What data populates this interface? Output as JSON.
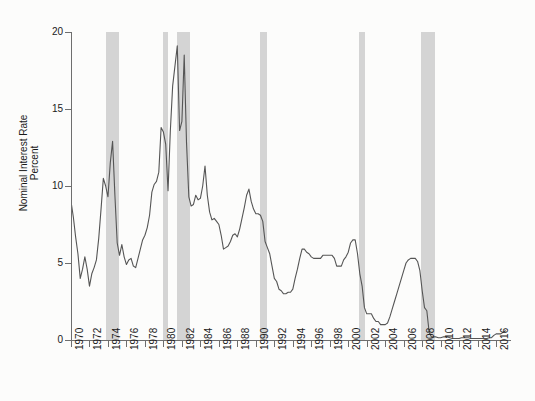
{
  "chart_data": {
    "type": "line",
    "title": "",
    "subtitle": "",
    "xlabel": "",
    "ylabel": "Nominal Interest Rate\nPercent",
    "ylabel_lines": [
      "Nominal Interest Rate",
      "Percent"
    ],
    "xlim": [
      1970,
      2017.5
    ],
    "ylim": [
      0,
      20
    ],
    "y_ticks": [
      0,
      5,
      10,
      15,
      20
    ],
    "y_tick_labels": [
      "0",
      "5",
      "10",
      "15",
      "20"
    ],
    "x_ticks": [
      1970,
      1972,
      1974,
      1976,
      1978,
      1980,
      1982,
      1984,
      1986,
      1988,
      1990,
      1992,
      1994,
      1996,
      1998,
      2000,
      2002,
      2004,
      2006,
      2008,
      2010,
      2012,
      2014,
      2016
    ],
    "x_tick_labels": [
      "1970",
      "1972",
      "1974",
      "1976",
      "1978",
      "1980",
      "1982",
      "1984",
      "1986",
      "1988",
      "1990",
      "1992",
      "1994",
      "1996",
      "1998",
      "2000",
      "2002",
      "2004",
      "2006",
      "2008",
      "2010",
      "2012",
      "2014",
      "2016"
    ],
    "grid": false,
    "legend": null,
    "line_color": "#555555",
    "band_color": "#d4d4d4",
    "background_color": "#fcfcfb",
    "axis_color": "#6e6e6e",
    "series": [
      {
        "name": "Nominal Interest Rate (Percent)",
        "x": [
          1970.0,
          1970.25,
          1970.5,
          1970.75,
          1971.0,
          1971.25,
          1971.5,
          1971.75,
          1972.0,
          1972.25,
          1972.5,
          1972.75,
          1973.0,
          1973.25,
          1973.5,
          1973.75,
          1974.0,
          1974.25,
          1974.5,
          1974.75,
          1975.0,
          1975.25,
          1975.5,
          1975.75,
          1976.0,
          1976.25,
          1976.5,
          1976.75,
          1977.0,
          1977.25,
          1977.5,
          1977.75,
          1978.0,
          1978.25,
          1978.5,
          1978.75,
          1979.0,
          1979.25,
          1979.5,
          1979.75,
          1980.0,
          1980.25,
          1980.5,
          1980.75,
          1981.0,
          1981.25,
          1981.5,
          1981.75,
          1982.0,
          1982.25,
          1982.5,
          1982.75,
          1983.0,
          1983.25,
          1983.5,
          1983.75,
          1984.0,
          1984.25,
          1984.5,
          1984.75,
          1985.0,
          1985.25,
          1985.5,
          1985.75,
          1986.0,
          1986.25,
          1986.5,
          1986.75,
          1987.0,
          1987.25,
          1987.5,
          1987.75,
          1988.0,
          1988.25,
          1988.5,
          1988.75,
          1989.0,
          1989.25,
          1989.5,
          1989.75,
          1990.0,
          1990.25,
          1990.5,
          1990.75,
          1991.0,
          1991.25,
          1991.5,
          1991.75,
          1992.0,
          1992.25,
          1992.5,
          1992.75,
          1993.0,
          1993.25,
          1993.5,
          1993.75,
          1994.0,
          1994.25,
          1994.5,
          1994.75,
          1995.0,
          1995.25,
          1995.5,
          1995.75,
          1996.0,
          1996.25,
          1996.5,
          1996.75,
          1997.0,
          1997.25,
          1997.5,
          1997.75,
          1998.0,
          1998.25,
          1998.5,
          1998.75,
          1999.0,
          1999.25,
          1999.5,
          1999.75,
          2000.0,
          2000.25,
          2000.5,
          2000.75,
          2001.0,
          2001.25,
          2001.5,
          2001.75,
          2002.0,
          2002.25,
          2002.5,
          2002.75,
          2003.0,
          2003.25,
          2003.5,
          2003.75,
          2004.0,
          2004.25,
          2004.5,
          2004.75,
          2005.0,
          2005.25,
          2005.5,
          2005.75,
          2006.0,
          2006.25,
          2006.5,
          2006.75,
          2007.0,
          2007.25,
          2007.5,
          2007.75,
          2008.0,
          2008.25,
          2008.5,
          2008.75,
          2009.0,
          2009.25,
          2009.5,
          2009.75,
          2010.0,
          2010.25,
          2010.5,
          2010.75,
          2011.0,
          2011.25,
          2011.5,
          2011.75,
          2012.0,
          2012.25,
          2012.5,
          2012.75,
          2013.0,
          2013.25,
          2013.5,
          2013.75,
          2014.0,
          2014.25,
          2014.5,
          2014.75,
          2015.0,
          2015.25,
          2015.5,
          2015.75,
          2016.0,
          2016.25,
          2016.5,
          2016.75,
          2017.0
        ],
        "y": [
          9.0,
          8.0,
          6.7,
          5.6,
          4.0,
          4.6,
          5.4,
          4.6,
          3.5,
          4.3,
          4.7,
          5.2,
          6.6,
          8.5,
          10.5,
          10.0,
          9.3,
          11.5,
          12.9,
          9.4,
          6.3,
          5.5,
          6.2,
          5.4,
          4.9,
          5.2,
          5.3,
          4.8,
          4.7,
          5.3,
          5.9,
          6.5,
          6.8,
          7.3,
          8.1,
          9.6,
          10.1,
          10.3,
          10.9,
          13.8,
          13.5,
          12.7,
          9.7,
          13.6,
          16.5,
          17.8,
          19.1,
          13.6,
          14.2,
          18.5,
          12.8,
          9.3,
          8.7,
          8.8,
          9.4,
          9.1,
          9.2,
          10.0,
          11.3,
          9.4,
          8.3,
          7.8,
          7.9,
          7.7,
          7.5,
          6.8,
          5.9,
          6.0,
          6.1,
          6.4,
          6.8,
          6.9,
          6.7,
          7.2,
          7.9,
          8.6,
          9.4,
          9.8,
          9.0,
          8.5,
          8.2,
          8.2,
          8.1,
          7.7,
          6.4,
          6.0,
          5.6,
          4.8,
          4.0,
          3.8,
          3.3,
          3.2,
          3.0,
          3.0,
          3.1,
          3.1,
          3.3,
          4.0,
          4.6,
          5.3,
          5.9,
          5.9,
          5.7,
          5.6,
          5.4,
          5.3,
          5.3,
          5.3,
          5.3,
          5.5,
          5.5,
          5.5,
          5.5,
          5.5,
          5.3,
          4.8,
          4.8,
          4.8,
          5.2,
          5.4,
          5.7,
          6.3,
          6.5,
          6.5,
          5.6,
          4.3,
          3.5,
          2.1,
          1.7,
          1.7,
          1.7,
          1.4,
          1.2,
          1.2,
          1.0,
          1.0,
          1.0,
          1.1,
          1.5,
          2.0,
          2.5,
          3.0,
          3.5,
          4.0,
          4.5,
          5.0,
          5.2,
          5.3,
          5.3,
          5.3,
          5.1,
          4.5,
          3.2,
          2.1,
          1.9,
          0.5,
          0.2,
          0.2,
          0.2,
          0.15,
          0.15,
          0.2,
          0.2,
          0.2,
          0.15,
          0.1,
          0.1,
          0.1,
          0.1,
          0.15,
          0.15,
          0.15,
          0.15,
          0.1,
          0.1,
          0.1,
          0.1,
          0.1,
          0.1,
          0.1,
          0.1,
          0.15,
          0.15,
          0.3,
          0.4,
          0.4,
          0.4,
          0.5,
          0.6
        ]
      }
    ],
    "recession_bands": [
      {
        "name": "1973-1975 recession",
        "start": 1973.83,
        "end": 1975.17
      },
      {
        "name": "1980 recession",
        "start": 1980.0,
        "end": 1980.5
      },
      {
        "name": "1981-1982 recession",
        "start": 1981.5,
        "end": 1982.92
      },
      {
        "name": "1990-1991 recession",
        "start": 1990.5,
        "end": 1991.17
      },
      {
        "name": "2001 recession",
        "start": 2001.17,
        "end": 2001.83
      },
      {
        "name": "2007-2009 recession",
        "start": 2007.92,
        "end": 2009.42
      }
    ]
  }
}
